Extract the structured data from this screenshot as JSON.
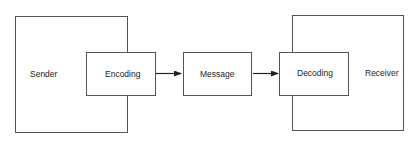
{
  "diagram": {
    "type": "communication-model",
    "nodes": [
      {
        "id": "sender",
        "label": "Sender"
      },
      {
        "id": "encoding",
        "label": "Encoding"
      },
      {
        "id": "message",
        "label": "Message"
      },
      {
        "id": "decoding",
        "label": "Decoding"
      },
      {
        "id": "receiver",
        "label": "Receiver"
      }
    ],
    "edges": [
      {
        "from": "encoding",
        "to": "message"
      },
      {
        "from": "message",
        "to": "decoding"
      }
    ],
    "containment": [
      {
        "container": "sender",
        "contains": "encoding"
      },
      {
        "container": "receiver",
        "contains": "decoding"
      }
    ],
    "colors": {
      "stroke": "#555555",
      "text": "#222222",
      "background": "#ffffff"
    }
  }
}
